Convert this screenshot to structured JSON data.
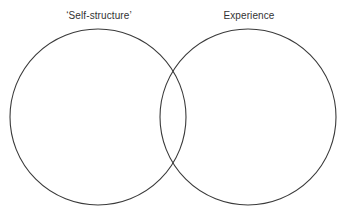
{
  "diagram": {
    "type": "venn-two-set",
    "background_color": "#ffffff",
    "stroke_color": "#3a3a3a",
    "label_color": "#333333",
    "width": 351,
    "height": 213,
    "sets": [
      {
        "id": "self-structure",
        "label": "‘Self-structure’",
        "center_x": 98,
        "center_y": 117,
        "radius": 88
      },
      {
        "id": "experience",
        "label": "Experience",
        "center_x": 248,
        "center_y": 117,
        "radius": 88
      }
    ],
    "intersection": {
      "top_point_x": 173,
      "top_point_y": 68,
      "bottom_point_x": 173,
      "bottom_point_y": 166
    }
  }
}
